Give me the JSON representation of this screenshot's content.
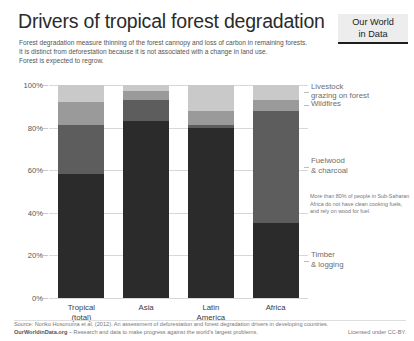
{
  "header": {
    "title": "Drivers of tropical forest degradation",
    "subtitle_lines": [
      "Forest degradation measure thinning of the forest cannopy and loss of carbon in remaining forests.",
      "It is distinct from deforestation because it is not associated with a change in land use.",
      "Forest is expected to regrow."
    ],
    "logo_line1": "Our World",
    "logo_line2": "in Data"
  },
  "annotation": "More than 80% of people in Sub-Saharan Africa do not have clean cooking fuels, and rely on wood for fuel.",
  "footer": {
    "source": "Source: Noriko Hosonuma et al. (2012). An assessment of deforestation and forest degradation drivers in developing countries.",
    "owid_link": "OurWorldinData.org",
    "tagline": "– Research and data to make progress against the world's largest problems.",
    "license": "Licensed under CC-BY."
  },
  "chart_data": {
    "type": "bar",
    "stacked": true,
    "title": "Drivers of tropical forest degradation",
    "xlabel": "",
    "ylabel": "",
    "ylim": [
      0,
      100
    ],
    "yticks": [
      "0%",
      "20%",
      "40%",
      "60%",
      "80%",
      "100%"
    ],
    "ytick_values": [
      0,
      20,
      40,
      60,
      80,
      100
    ],
    "grid": true,
    "legend_position": "right",
    "categories": [
      "Tropical (total)",
      "Asia",
      "Latin America",
      "Africa"
    ],
    "category_labels": [
      [
        "Tropical",
        "(total)"
      ],
      [
        "Asia"
      ],
      [
        "Latin",
        "America"
      ],
      [
        "Africa"
      ]
    ],
    "series": [
      {
        "name": "Timber & logging",
        "legend_lines": [
          "Timber",
          "& logging"
        ],
        "color": "#2b2b2b",
        "values": [
          58,
          83,
          80,
          35
        ]
      },
      {
        "name": "Fuelwood & charcoal",
        "legend_lines": [
          "Fuelwood",
          "& charcoal"
        ],
        "color": "#5d5d5d",
        "values": [
          23,
          10,
          1,
          53
        ]
      },
      {
        "name": "Wildfires",
        "legend_lines": [
          "Wildfires"
        ],
        "color": "#9a9a9a",
        "values": [
          11,
          4,
          7,
          5
        ]
      },
      {
        "name": "Livestock grazing on forest",
        "legend_lines": [
          "Livestock",
          "grazing on forest"
        ],
        "color": "#c9c9c9",
        "values": [
          8,
          3,
          12,
          7
        ]
      }
    ]
  }
}
